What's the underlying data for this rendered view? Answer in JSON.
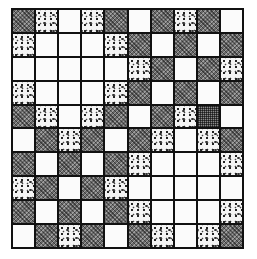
{
  "figure": {
    "title": "",
    "rows": 10,
    "cols": 10,
    "legend": {
      "W": "white",
      "D": "dark-checkered",
      "S": "stippled-dots",
      "G": "fine-crosshatch"
    },
    "colors": {
      "border": "#111111",
      "white": "#fbfbfb",
      "dark": "#6a6a6a",
      "stipple_bg": "#f4f4f4",
      "crosshatch": "#8a8a8a"
    },
    "grid": [
      [
        "D",
        "S",
        "W",
        "S",
        "D",
        "W",
        "D",
        "S",
        "D",
        "W"
      ],
      [
        "S",
        "W",
        "W",
        "W",
        "S",
        "D",
        "W",
        "D",
        "W",
        "D"
      ],
      [
        "W",
        "W",
        "W",
        "W",
        "W",
        "S",
        "D",
        "W",
        "D",
        "S"
      ],
      [
        "S",
        "W",
        "W",
        "W",
        "S",
        "D",
        "W",
        "D",
        "W",
        "D"
      ],
      [
        "D",
        "S",
        "W",
        "S",
        "D",
        "W",
        "D",
        "S",
        "G",
        "W"
      ],
      [
        "W",
        "D",
        "S",
        "D",
        "W",
        "D",
        "S",
        "W",
        "S",
        "D"
      ],
      [
        "D",
        "W",
        "D",
        "W",
        "D",
        "S",
        "W",
        "W",
        "W",
        "S"
      ],
      [
        "S",
        "D",
        "W",
        "D",
        "S",
        "W",
        "W",
        "W",
        "W",
        "W"
      ],
      [
        "D",
        "W",
        "D",
        "W",
        "D",
        "S",
        "W",
        "W",
        "W",
        "S"
      ],
      [
        "W",
        "D",
        "S",
        "D",
        "W",
        "D",
        "S",
        "W",
        "S",
        "D"
      ]
    ]
  }
}
